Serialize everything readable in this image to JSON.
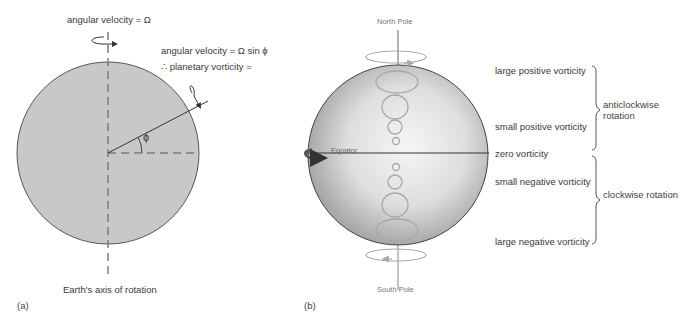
{
  "panel_a": {
    "label": "(a)",
    "axis_top_label": "angular velocity = Ω",
    "tilted_label_line1": "angular velocity = Ω sin ϕ",
    "tilted_label_line2": "∴ planetary vorticity =",
    "angle_symbol": "ϕ",
    "axis_bottom_label": "Earth's axis of rotation",
    "colors": {
      "disc_fill": "#c8c8c8",
      "outline": "#555555",
      "axis": "#777777"
    }
  },
  "panel_b": {
    "label": "(b)",
    "north_pole": "North Pole",
    "south_pole": "South Pole",
    "equator": "Equator",
    "vorticity_levels": [
      {
        "label": "large positive vorticity"
      },
      {
        "label": "small positive vorticity"
      },
      {
        "label": "zero vorticity"
      },
      {
        "label": "small negative vorticity"
      },
      {
        "label": "large negative vorticity"
      }
    ],
    "groups": [
      {
        "label": "anticlockwise rotation",
        "spans": "positive vorticity"
      },
      {
        "label": "clockwise rotation",
        "spans": "negative vorticity"
      }
    ],
    "colors": {
      "sphere_light": "#f4f4f4",
      "sphere_dark": "#9a9a9a",
      "eddy": "#a8a8a8",
      "equator_arrow": "#555555"
    }
  }
}
